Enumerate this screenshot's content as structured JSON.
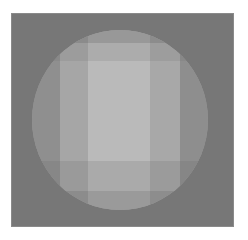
{
  "image": {
    "description": "Grayscale faceted shaded sphere on a gray square background",
    "background_color": "#777777",
    "sphere_base_color": "#9a9a9a",
    "vertical_bands": [
      {
        "left": 0,
        "width": 28,
        "color": "#8f8f8f"
      },
      {
        "left": 28,
        "width": 28,
        "color": "#a6a6a6"
      },
      {
        "left": 56,
        "width": 62,
        "color": "#b8b8b8"
      },
      {
        "left": 118,
        "width": 30,
        "color": "#a8a8a8"
      },
      {
        "left": 148,
        "width": 28,
        "color": "#909090"
      }
    ],
    "horizontal_bands": [
      {
        "top": 0,
        "height": 13,
        "color": "#8a8a8a"
      },
      {
        "top": 13,
        "height": 18,
        "color": "#a2a2a2"
      },
      {
        "top": 118,
        "height": 30,
        "color": "#a0a0a0"
      },
      {
        "top": 148,
        "height": 20,
        "color": "#8c8c8c"
      },
      {
        "top": 168,
        "height": 12,
        "color": "#7e7e7e"
      }
    ]
  }
}
